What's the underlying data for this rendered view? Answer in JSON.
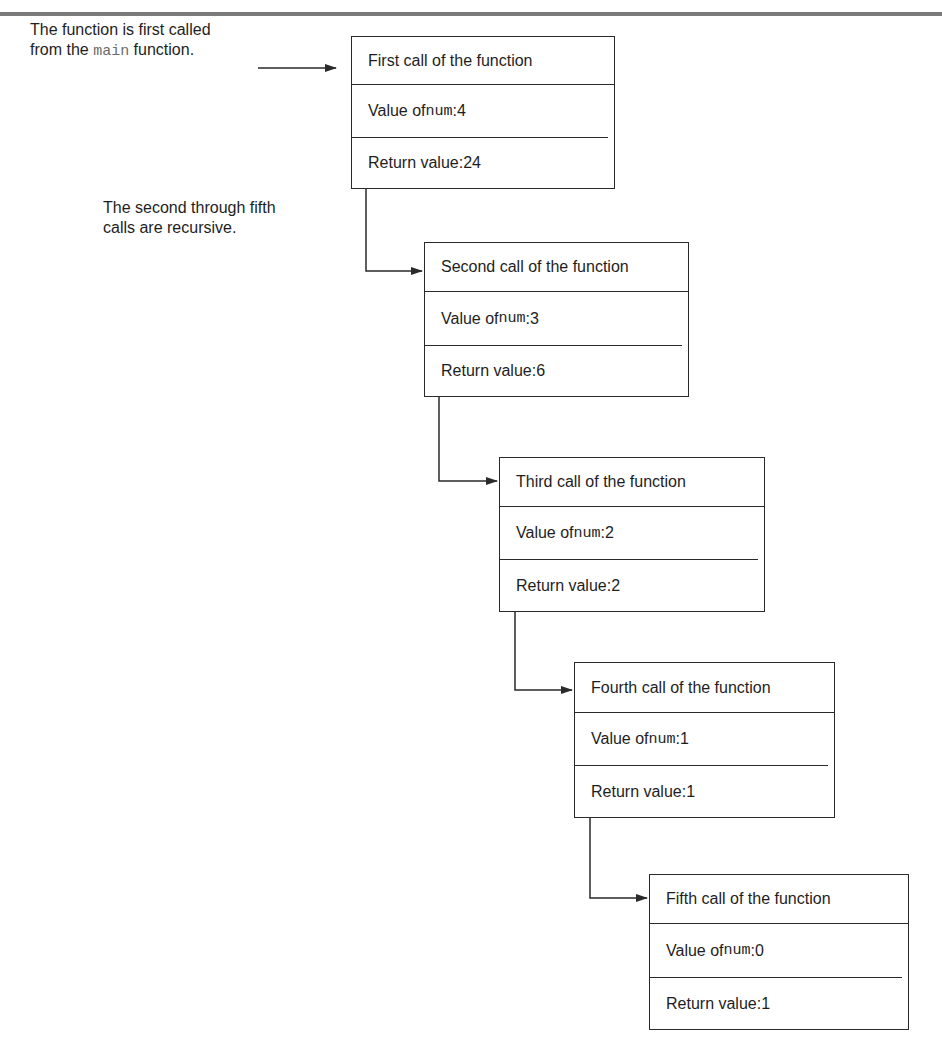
{
  "annotations": {
    "first_call_line1": "The function is first called",
    "first_call_line2_pre": "from the ",
    "first_call_code": "main",
    "first_call_line2_post": " function.",
    "recursive_line1": "The second through fifth",
    "recursive_line2": "calls are recursive."
  },
  "labels": {
    "value_prefix": "Value of ",
    "var_name": "num",
    "value_sep": ": ",
    "return_prefix": "Return value: "
  },
  "calls": [
    {
      "title": "First call of the function",
      "num": "4",
      "return_value": "24"
    },
    {
      "title": "Second call of the function",
      "num": "3",
      "return_value": "6"
    },
    {
      "title": "Third call of the function",
      "num": "2",
      "return_value": "2"
    },
    {
      "title": "Fourth call of the function",
      "num": "1",
      "return_value": "1"
    },
    {
      "title": "Fifth call of the function",
      "num": "0",
      "return_value": "1"
    }
  ],
  "colors": {
    "line": "#2a2a2a",
    "text": "#1e1e1e",
    "code_muted": "#6b6b6b",
    "top_rule": "#7a7a7a"
  }
}
